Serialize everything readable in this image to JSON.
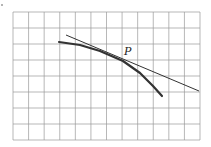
{
  "figure": {
    "point_label": "P",
    "grid": {
      "cols": 12,
      "rows": 8,
      "left": 13,
      "top": 12,
      "right": 200,
      "bottom": 140,
      "color": "#9a9a9a"
    },
    "curve": {
      "color": "#333333",
      "points": [
        [
          59,
          42
        ],
        [
          80,
          45
        ],
        [
          100,
          51
        ],
        [
          123,
          61
        ],
        [
          140,
          73
        ],
        [
          153,
          86
        ],
        [
          162,
          96
        ]
      ]
    },
    "tangent": {
      "color": "#333333",
      "x1": 66,
      "y1": 35,
      "x2": 199,
      "y2": 91
    },
    "point": {
      "x": 123,
      "y": 61
    },
    "corner_dot": {
      "x": 2,
      "y": 5
    }
  }
}
